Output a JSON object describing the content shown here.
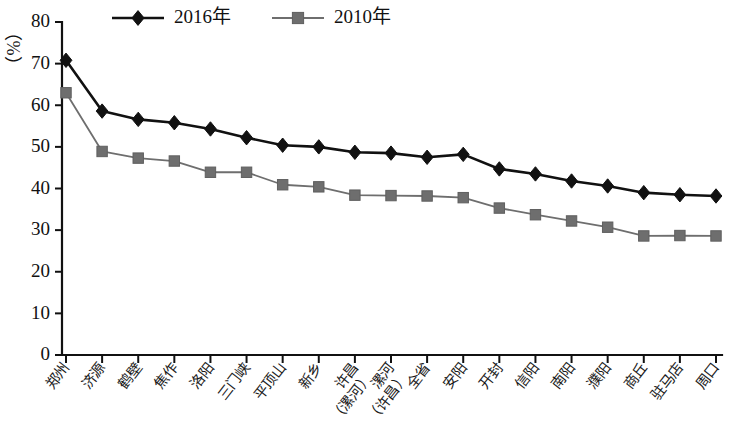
{
  "chart_data": {
    "type": "line",
    "title": "",
    "subtitle": "",
    "xlabel": "",
    "ylabel": "",
    "unit_label": "（%）",
    "ylim": [
      0,
      80
    ],
    "ytick_step": 10,
    "yticks": [
      0,
      10,
      20,
      30,
      40,
      50,
      60,
      70,
      80
    ],
    "grid": false,
    "legend_position": "top-center",
    "categories": [
      "郑州",
      "济源",
      "鹤壁",
      "焦作",
      "洛阳",
      "三门峡",
      "平顶山",
      "新乡",
      "许昌\n（漯河）",
      "漯河\n（许昌）",
      "全省",
      "安阳",
      "开封",
      "信阳",
      "南阳",
      "濮阳",
      "商丘",
      "驻马店",
      "周口"
    ],
    "series": [
      {
        "name": "2016年",
        "marker": "diamond",
        "color": "#111111",
        "values": [
          70.8,
          58.6,
          56.6,
          55.8,
          54.3,
          52.2,
          50.4,
          50.0,
          48.7,
          48.5,
          47.5,
          48.2,
          44.7,
          43.5,
          41.8,
          40.6,
          39.0,
          38.5,
          38.2
        ]
      },
      {
        "name": "2010年",
        "marker": "square",
        "color": "#6e6e6e",
        "values": [
          63.0,
          48.9,
          47.3,
          46.6,
          43.9,
          43.9,
          40.9,
          40.4,
          38.4,
          38.3,
          38.2,
          37.8,
          35.3,
          33.7,
          32.2,
          30.7,
          28.6,
          28.7,
          28.6
        ]
      }
    ]
  },
  "legend": {
    "items": [
      {
        "label": "2016年",
        "marker": "diamond",
        "color": "#111111"
      },
      {
        "label": "2010年",
        "marker": "square",
        "color": "#6e6e6e"
      }
    ]
  },
  "axes": {
    "y_unit": "（%）",
    "y_max_label": "80",
    "y_min_label": "0"
  }
}
